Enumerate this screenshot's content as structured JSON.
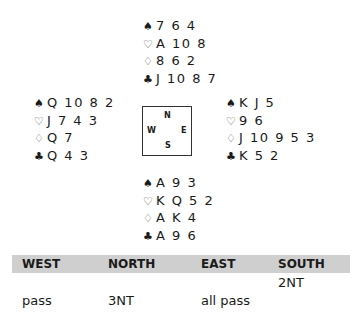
{
  "hands": {
    "north": {
      "spades": "7 6 4",
      "hearts": "A 10 8",
      "diamonds": "8 6 2",
      "clubs": "J 10 8 7"
    },
    "west": {
      "spades": "Q 10 8 2",
      "hearts": "J 7 4 3",
      "diamonds": "Q 7",
      "clubs": "Q 4 3"
    },
    "east": {
      "spades": "K J 5",
      "hearts": "9 6",
      "diamonds": "J 10 9 5 3",
      "clubs": "K 5 2"
    },
    "south": {
      "spades": "A 9 3",
      "hearts": "K Q 5 2",
      "diamonds": "A K 4",
      "clubs": "A 9 6"
    }
  },
  "suit_icons": {
    "spades": "♠",
    "hearts": "♡",
    "diamonds": "♢",
    "clubs": "♣"
  },
  "compass": {
    "n": "N",
    "w": "W",
    "e": "E",
    "s": "S"
  },
  "auction": {
    "headers": [
      "WEST",
      "NORTH",
      "EAST",
      "SOUTH"
    ],
    "rows": [
      [
        "",
        "",
        "",
        "2NT"
      ],
      [
        "pass",
        "3NT",
        "all pass",
        ""
      ]
    ],
    "header_bg": "#cfcfcf"
  }
}
